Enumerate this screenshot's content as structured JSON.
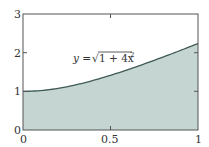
{
  "chart_data": {
    "type": "area",
    "title": "",
    "xlabel": "",
    "ylabel": "",
    "xlim": [
      0,
      1
    ],
    "ylim": [
      0,
      3
    ],
    "grid": false,
    "legend": null,
    "x_ticks": [
      0,
      0.5,
      1
    ],
    "x_tick_labels": [
      "0",
      "0.5",
      "1"
    ],
    "y_ticks": [
      0,
      1,
      2,
      3
    ],
    "y_tick_labels": [
      "0",
      "1",
      "2",
      "3"
    ],
    "series": [
      {
        "name": "y = √(1 + 4x²)",
        "function": "sqrt(1 + 4x^2)",
        "x": [
          0,
          0.1,
          0.2,
          0.3,
          0.4,
          0.5,
          0.6,
          0.7,
          0.8,
          0.9,
          1.0
        ],
        "values": [
          1.0,
          1.02,
          1.077,
          1.166,
          1.281,
          1.414,
          1.562,
          1.72,
          1.887,
          2.059,
          2.236
        ],
        "fill": true,
        "fill_color": "#c5d6d2",
        "line_color": "#3f5a55"
      }
    ],
    "annotations": [
      {
        "text_prefix": "y = ",
        "text_radical": "1 + 4x",
        "text_superscript": "2",
        "x": 0.27,
        "y": 1.9
      }
    ]
  },
  "labels": {
    "x0": "0",
    "x05": "0.5",
    "x1": "1",
    "y0": "0",
    "y1": "1",
    "y2": "2",
    "y3": "3",
    "annot_prefix": "y = ",
    "annot_radical": "√",
    "annot_body": "1 + 4x",
    "annot_sup": "2"
  },
  "colors": {
    "fill": "#c5d6d2",
    "line": "#3f5a55",
    "axis": "#555555"
  }
}
